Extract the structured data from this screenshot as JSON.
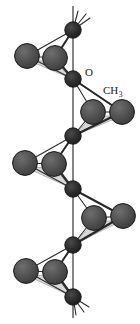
{
  "figure": {
    "kind": "molecular-structure-diagram",
    "caption_labels": {
      "oxygen": "O",
      "methyl": "CH",
      "methyl_subscript": "3"
    },
    "colors": {
      "background": "#ffffff",
      "backbone_atom": "#262626",
      "substituent_atom": "#4d4d4d",
      "atom_outline": "#1a1a1a",
      "bond_line": "#2b2b2b",
      "face_shading": "#d8d8d8",
      "face_shading_edge": "#9a9a9a",
      "label_text": "#1a1a1a"
    },
    "geometry": {
      "width": 140,
      "height": 324,
      "axis_x": 73,
      "axis_top": 6,
      "axis_bottom": 318,
      "backbone_radius": 8.2,
      "substituent_radius": 12.4,
      "backbone_atoms": [
        {
          "id": "b0",
          "x": 73,
          "y": 30,
          "terminal": true
        },
        {
          "id": "b1",
          "x": 73,
          "y": 79,
          "label": "O"
        },
        {
          "id": "b2",
          "x": 73,
          "y": 136
        },
        {
          "id": "b3",
          "x": 73,
          "y": 189
        },
        {
          "id": "b4",
          "x": 73,
          "y": 245
        },
        {
          "id": "b5",
          "x": 73,
          "y": 297,
          "terminal": true
        }
      ],
      "substituent_groups": [
        {
          "id": "g1",
          "side": "left",
          "anchor_top": "b0",
          "anchor_bottom": "b1",
          "atoms": [
            {
              "id": "g1a",
              "x": 27,
              "y": 56
            },
            {
              "id": "g1b",
              "x": 55,
              "y": 58
            }
          ]
        },
        {
          "id": "g2",
          "side": "right",
          "anchor_top": "b1",
          "anchor_bottom": "b2",
          "labelled": true,
          "atoms": [
            {
              "id": "g2a",
              "x": 93,
              "y": 112
            },
            {
              "id": "g2b",
              "x": 122,
              "y": 112
            }
          ]
        },
        {
          "id": "g3",
          "side": "left",
          "anchor_top": "b2",
          "anchor_bottom": "b3",
          "atoms": [
            {
              "id": "g3a",
              "x": 25,
              "y": 163
            },
            {
              "id": "g3b",
              "x": 54,
              "y": 164
            }
          ]
        },
        {
          "id": "g4",
          "side": "right",
          "anchor_top": "b3",
          "anchor_bottom": "b4",
          "atoms": [
            {
              "id": "g4a",
              "x": 94,
              "y": 218
            },
            {
              "id": "g4b",
              "x": 123,
              "y": 216
            }
          ]
        },
        {
          "id": "g5",
          "side": "left",
          "anchor_top": "b4",
          "anchor_bottom": "b5",
          "atoms": [
            {
              "id": "g5a",
              "x": 26,
              "y": 271
            },
            {
              "id": "g5b",
              "x": 55,
              "y": 272
            }
          ]
        }
      ],
      "terminal_stubs": [
        {
          "from": "b0",
          "dx": 17,
          "dy": -12
        },
        {
          "from": "b0",
          "dx": 13,
          "dy": -16
        },
        {
          "from": "b0",
          "dx": 5,
          "dy": -19
        },
        {
          "from": "b5",
          "dx": 16,
          "dy": 10
        },
        {
          "from": "b5",
          "dx": 11,
          "dy": 15
        },
        {
          "from": "b5",
          "dx": 3,
          "dy": 18
        }
      ],
      "labels": [
        {
          "text": "O",
          "x": 85,
          "y": 76,
          "kind": "oxygen"
        },
        {
          "text": "CH",
          "x": 103,
          "y": 94,
          "kind": "methyl"
        }
      ]
    }
  }
}
